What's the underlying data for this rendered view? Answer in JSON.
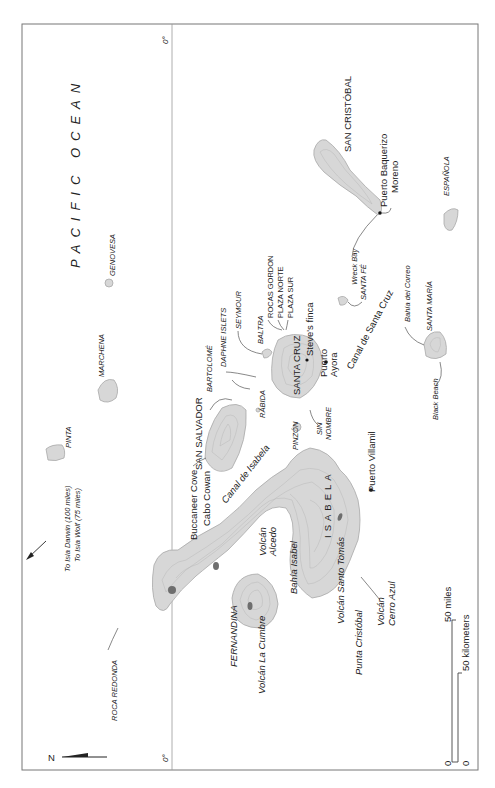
{
  "map": {
    "orientation": "rotated 90° counterclockwise (north points left)",
    "ocean_label": "PACIFIC OCEAN",
    "equator_label_top": "0°",
    "equator_label_bottom": "0°",
    "north_arrow": "N",
    "offmap_note": {
      "line1": "To Isla Darwin (100 miles)",
      "line2": "To Isla Wolf (75 miles)"
    },
    "islands": [
      {
        "name": "PINTA"
      },
      {
        "name": "MARCHENA"
      },
      {
        "name": "GENOVESA"
      },
      {
        "name": "SAN SALVADOR"
      },
      {
        "name": "BARTOLOMÉ"
      },
      {
        "name": "DAPHNE ISLETS"
      },
      {
        "name": "SEYMOUR"
      },
      {
        "name": "BALTRA"
      },
      {
        "name": "ROCAS GORDON"
      },
      {
        "name": "PLAZA NORTE"
      },
      {
        "name": "PLAZA SUR"
      },
      {
        "name": "SANTA CRUZ"
      },
      {
        "name": "RÁBIDA"
      },
      {
        "name": "PINZÓN"
      },
      {
        "name": "SIN NOMBRE"
      },
      {
        "name": "SANTA FÉ"
      },
      {
        "name": "SAN CRISTÓBAL"
      },
      {
        "name": "ESPAÑOLA"
      },
      {
        "name": "SANTA MARÍA"
      },
      {
        "name": "ISABELA"
      },
      {
        "name": "FERNANDINA"
      },
      {
        "name": "ROCA REDONDA"
      }
    ],
    "places": {
      "buccaneer_cove": "Buccaneer Cove",
      "cabo_cowan": "Cabo Cowan",
      "canal_isabela": "Canal de Isabela",
      "steves_finca": "Steve's finca",
      "puerto_ayora_1": "Puerto",
      "puerto_ayora_2": "Ayora",
      "canal_santa_cruz": "Canal de Santa Cruz",
      "wreck_bay": "Wreck Bay",
      "puerto_baquerizo_1": "Puerto Baquerizo",
      "puerto_baquerizo_2": "Moreno",
      "bahia_correo": "Bahía del Correo",
      "black_beach": "Black Beach",
      "puerto_villamil": "Puerto Villamil",
      "volcan_alcedo_1": "Volcán",
      "volcan_alcedo_2": "Alcedo",
      "bahia_isabel": "Bahía Isabel",
      "volcan_santo_tomas": "Volcán Santo Tomás",
      "volcan_cerro_azul_1": "Volcán",
      "volcan_cerro_azul_2": "Cerro Azul",
      "punta_cristobal": "Punta Cristóbal",
      "volcan_la_cumbre": "Volcán La Cumbre"
    },
    "scale": {
      "miles_label": "50 miles",
      "km_label": "50 kilometers",
      "zero_miles": "0",
      "zero_km": "0"
    },
    "colors": {
      "land": "#d7d7d7",
      "land_stroke": "#a8a8a8",
      "peak": "#6e6e6e",
      "frame": "#777777",
      "text": "#222222"
    }
  }
}
